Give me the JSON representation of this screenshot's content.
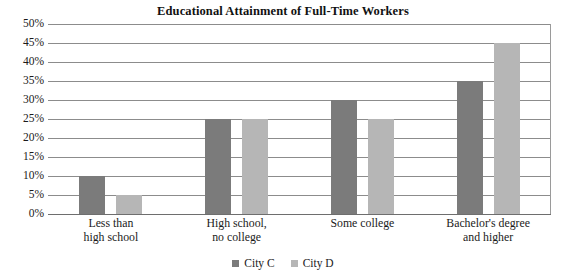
{
  "chart_data": {
    "type": "bar",
    "title": "Educational Attainment of Full-Time Workers",
    "xlabel": "",
    "ylabel": "",
    "ylim": [
      0,
      50
    ],
    "ytick_step": 5,
    "ytick_labels": [
      "50%",
      "45%",
      "40%",
      "35%",
      "30%",
      "25%",
      "20%",
      "15%",
      "10%",
      "5%",
      "0%"
    ],
    "ytick_values": [
      50,
      45,
      40,
      35,
      30,
      25,
      20,
      15,
      10,
      5,
      0
    ],
    "grid": true,
    "legend_position": "bottom-center",
    "categories": [
      "Less than high school",
      "High school, no college",
      "Some college",
      "Bachelor's degree and higher"
    ],
    "category_lines": [
      [
        "Less than",
        "high school"
      ],
      [
        "High school,",
        "no college"
      ],
      [
        "Some college",
        ""
      ],
      [
        "Bachelor's degree",
        "and higher"
      ]
    ],
    "series": [
      {
        "name": "City C",
        "color": "#7b7b7b",
        "values": [
          10,
          25,
          30,
          35
        ]
      },
      {
        "name": "City D",
        "color": "#b6b6b6",
        "values": [
          5,
          25,
          25,
          45
        ]
      }
    ]
  },
  "legend": {
    "items": [
      {
        "label": "City C",
        "color": "#7b7b7b"
      },
      {
        "label": "City D",
        "color": "#b6b6b6"
      }
    ]
  },
  "colors": {
    "series_c": "#7b7b7b",
    "series_d": "#b6b6b6",
    "gridline": "#8c8c8c",
    "axis": "#6e6e6e",
    "text": "#1a1a1a",
    "background": "#ffffff"
  }
}
